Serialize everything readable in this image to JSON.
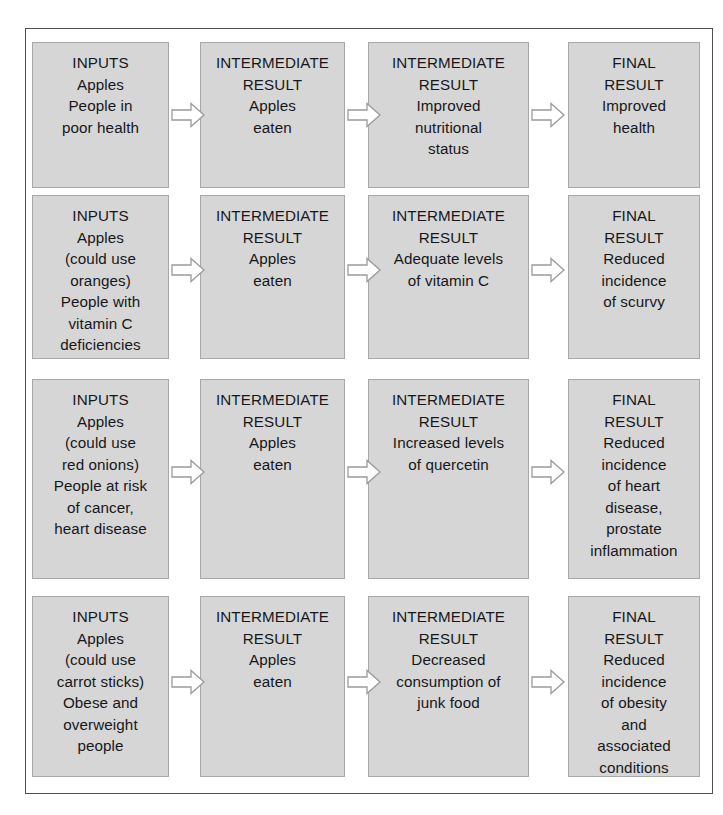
{
  "figure": {
    "colors": {
      "box_fill": "#d6d6d6",
      "box_border": "#a8a8a8",
      "frame_border": "#4e4e4e",
      "arrow_fill": "#ffffff",
      "arrow_border": "#9a9a9a",
      "text": "#17171a",
      "background": "#ffffff"
    },
    "columns": [
      "INPUTS",
      "INTERMEDIATE RESULT",
      "INTERMEDIATE RESULT",
      "FINAL RESULT"
    ],
    "arrow_count_per_row": 3,
    "row_count": 4
  },
  "rows": [
    {
      "id": "row-1",
      "cells": [
        {
          "header": [
            "INPUTS"
          ],
          "lines": [
            "Apples",
            "People in",
            "poor health"
          ]
        },
        {
          "header": [
            "INTERMEDIATE",
            "RESULT"
          ],
          "lines": [
            "Apples",
            "eaten"
          ]
        },
        {
          "header": [
            "INTERMEDIATE",
            "RESULT"
          ],
          "lines": [
            "Improved",
            "nutritional",
            "status"
          ]
        },
        {
          "header": [
            "FINAL",
            "RESULT"
          ],
          "lines": [
            "Improved",
            "health"
          ]
        }
      ]
    },
    {
      "id": "row-2",
      "cells": [
        {
          "header": [
            "INPUTS"
          ],
          "lines": [
            "Apples",
            "(could use",
            "oranges)",
            "People with",
            "vitamin C",
            "deficiencies"
          ]
        },
        {
          "header": [
            "INTERMEDIATE",
            "RESULT"
          ],
          "lines": [
            "Apples",
            "eaten"
          ]
        },
        {
          "header": [
            "INTERMEDIATE",
            "RESULT"
          ],
          "lines": [
            "Adequate levels",
            "of vitamin C"
          ]
        },
        {
          "header": [
            "FINAL",
            "RESULT"
          ],
          "lines": [
            "Reduced",
            "incidence",
            "of scurvy"
          ]
        }
      ]
    },
    {
      "id": "row-3",
      "cells": [
        {
          "header": [
            "INPUTS"
          ],
          "lines": [
            "Apples",
            "(could use",
            "red onions)",
            "People at risk",
            "of cancer,",
            "heart disease"
          ]
        },
        {
          "header": [
            "INTERMEDIATE",
            "RESULT"
          ],
          "lines": [
            "Apples",
            "eaten"
          ]
        },
        {
          "header": [
            "INTERMEDIATE",
            "RESULT"
          ],
          "lines": [
            "Increased levels",
            "of quercetin"
          ]
        },
        {
          "header": [
            "FINAL",
            "RESULT"
          ],
          "lines": [
            "Reduced",
            "incidence",
            "of heart",
            "disease,",
            "prostate",
            "inflammation"
          ]
        }
      ]
    },
    {
      "id": "row-4",
      "cells": [
        {
          "header": [
            "INPUTS"
          ],
          "lines": [
            "Apples",
            "(could use",
            "carrot sticks)",
            "Obese and",
            "overweight",
            "people"
          ]
        },
        {
          "header": [
            "INTERMEDIATE",
            "RESULT"
          ],
          "lines": [
            "Apples",
            "eaten"
          ]
        },
        {
          "header": [
            "INTERMEDIATE",
            "RESULT"
          ],
          "lines": [
            "Decreased",
            "consumption of",
            "junk food"
          ]
        },
        {
          "header": [
            "FINAL",
            "RESULT"
          ],
          "lines": [
            "Reduced",
            "incidence",
            "of obesity",
            "and",
            "associated",
            "conditions"
          ]
        }
      ]
    }
  ]
}
